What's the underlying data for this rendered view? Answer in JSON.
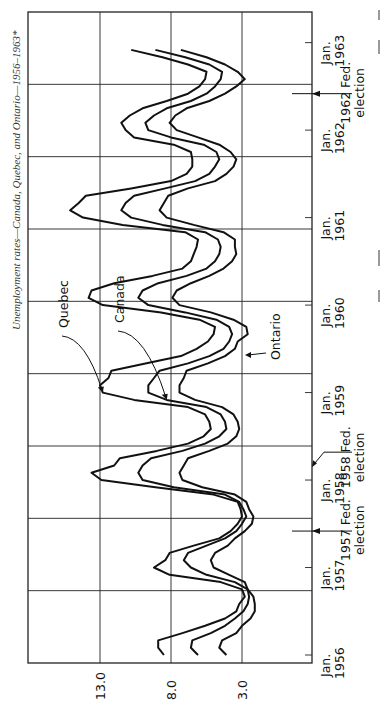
{
  "chart_data": {
    "type": "line",
    "orientation": "rotated-90-ccw",
    "title": "Unemployment rates—Canada, Quebec, and Ontario—1956–1963*",
    "xlabel": "",
    "ylabel": "",
    "x_unit": "month",
    "x_range": [
      "1956-01",
      "1963-01"
    ],
    "y_range": [
      -2,
      18
    ],
    "y_ticks": [
      {
        "value": 3.0,
        "label": "3.0"
      },
      {
        "value": 8.0,
        "label": "8.0"
      },
      {
        "value": 13.0,
        "label": "13.0"
      }
    ],
    "x_ticks": [
      {
        "month": 0,
        "label_line1": "Jan.",
        "label_line2": "1956"
      },
      {
        "month": 12,
        "label_line1": "Jan.",
        "label_line2": "1957"
      },
      {
        "month": 24,
        "label_line1": "Jan.",
        "label_line2": "1958"
      },
      {
        "month": 36,
        "label_line1": "Jan.",
        "label_line2": "1959"
      },
      {
        "month": 48,
        "label_line1": "Jan.",
        "label_line2": "1960"
      },
      {
        "month": 60,
        "label_line1": "Jan.",
        "label_line2": "1961"
      },
      {
        "month": 72,
        "label_line1": "Jan.",
        "label_line2": "1962"
      },
      {
        "month": 84,
        "label_line1": "Jan.",
        "label_line2": "1963"
      }
    ],
    "grid": true,
    "legend": "inline labels with leader arrows",
    "series": [
      {
        "name": "Quebec",
        "months": [
          0,
          1,
          2,
          3,
          4,
          5,
          6,
          7,
          8,
          9,
          10,
          11,
          12,
          13,
          14,
          15,
          16,
          17,
          18,
          19,
          20,
          21,
          22,
          23,
          24,
          25,
          26,
          27,
          28,
          29,
          30,
          31,
          32,
          33,
          34,
          35,
          36,
          37,
          38,
          39,
          40,
          41,
          42,
          43,
          44,
          45,
          46,
          47,
          48,
          49,
          50,
          51,
          52,
          53,
          54,
          55,
          56,
          57,
          58,
          59,
          60,
          61,
          62,
          63,
          64,
          65,
          66,
          67,
          68,
          69,
          70,
          71,
          72,
          73,
          74,
          75,
          76,
          77,
          78,
          79,
          80,
          81,
          82,
          83
        ],
        "values": [
          8.5,
          8.9,
          8.9,
          7.2,
          5.6,
          4.2,
          3.4,
          3.2,
          2.8,
          3.0,
          4.5,
          8.1,
          9.2,
          8.4,
          8.1,
          6.4,
          4.6,
          3.8,
          3.3,
          3.0,
          3.1,
          3.3,
          5.0,
          9.1,
          12.9,
          13.6,
          12.0,
          11.6,
          9.0,
          6.8,
          5.7,
          5.2,
          5.3,
          5.6,
          6.8,
          10.6,
          12.8,
          13.0,
          12.4,
          12.2,
          9.8,
          7.3,
          6.2,
          5.4,
          5.0,
          4.9,
          6.0,
          8.7,
          12.8,
          13.8,
          13.6,
          12.0,
          9.3,
          7.2,
          6.6,
          6.4,
          6.2,
          6.1,
          7.0,
          11.4,
          14.2,
          15.1,
          14.5,
          14.0,
          10.8,
          8.0,
          6.9,
          6.5,
          6.5,
          6.6,
          7.8,
          10.6,
          11.2,
          11.5,
          10.9,
          10.0,
          8.3,
          6.8,
          6.0,
          5.6,
          5.5,
          6.8,
          8.6,
          10.8
        ]
      },
      {
        "name": "Canada",
        "months": [
          0,
          1,
          2,
          3,
          4,
          5,
          6,
          7,
          8,
          9,
          10,
          11,
          12,
          13,
          14,
          15,
          16,
          17,
          18,
          19,
          20,
          21,
          22,
          23,
          24,
          25,
          26,
          27,
          28,
          29,
          30,
          31,
          32,
          33,
          34,
          35,
          36,
          37,
          38,
          39,
          40,
          41,
          42,
          43,
          44,
          45,
          46,
          47,
          48,
          49,
          50,
          51,
          52,
          53,
          54,
          55,
          56,
          57,
          58,
          59,
          60,
          61,
          62,
          63,
          64,
          65,
          66,
          67,
          68,
          69,
          70,
          71,
          72,
          73,
          74,
          75,
          76,
          77,
          78,
          79,
          80,
          81,
          82,
          83
        ],
        "values": [
          6.1,
          6.6,
          6.5,
          5.2,
          4.2,
          3.5,
          2.9,
          2.6,
          2.5,
          2.6,
          3.5,
          5.5,
          6.6,
          7.1,
          6.8,
          5.5,
          4.2,
          3.4,
          3.0,
          2.7,
          2.9,
          3.2,
          4.2,
          7.8,
          10.0,
          10.3,
          10.0,
          9.4,
          7.2,
          5.6,
          4.6,
          4.1,
          4.2,
          4.5,
          5.5,
          8.3,
          9.6,
          9.6,
          9.2,
          8.8,
          6.8,
          5.3,
          4.3,
          3.9,
          3.7,
          3.9,
          4.8,
          7.0,
          9.6,
          10.3,
          10.0,
          8.9,
          6.9,
          5.5,
          4.9,
          4.6,
          4.5,
          4.7,
          5.6,
          8.6,
          10.8,
          11.5,
          11.2,
          10.6,
          8.4,
          6.3,
          5.3,
          4.9,
          4.6,
          4.8,
          5.7,
          8.0,
          9.6,
          9.8,
          9.2,
          8.3,
          6.6,
          5.5,
          4.9,
          4.5,
          4.4,
          5.3,
          7.0,
          9.1
        ]
      },
      {
        "name": "Ontario",
        "months": [
          0,
          1,
          2,
          3,
          4,
          5,
          6,
          7,
          8,
          9,
          10,
          11,
          12,
          13,
          14,
          15,
          16,
          17,
          18,
          19,
          20,
          21,
          22,
          23,
          24,
          25,
          26,
          27,
          28,
          29,
          30,
          31,
          32,
          33,
          34,
          35,
          36,
          37,
          38,
          39,
          40,
          41,
          42,
          43,
          44,
          45,
          46,
          47,
          48,
          49,
          50,
          51,
          52,
          53,
          54,
          55,
          56,
          57,
          58,
          59,
          60,
          61,
          62,
          63,
          64,
          65,
          66,
          67,
          68,
          69,
          70,
          71,
          72,
          73,
          74,
          75,
          76,
          77,
          78,
          79,
          80,
          81,
          82,
          83
        ],
        "values": [
          4.1,
          4.6,
          4.4,
          3.4,
          3.0,
          2.4,
          2.1,
          2.1,
          2.2,
          2.6,
          2.8,
          3.9,
          5.0,
          5.2,
          4.9,
          4.0,
          3.5,
          2.8,
          2.3,
          2.2,
          2.5,
          2.7,
          3.5,
          5.8,
          7.2,
          7.4,
          7.1,
          6.8,
          5.3,
          4.0,
          3.4,
          3.2,
          3.3,
          3.6,
          4.4,
          6.3,
          7.4,
          7.4,
          7.1,
          6.9,
          5.4,
          4.2,
          3.5,
          3.3,
          2.6,
          2.7,
          3.6,
          5.2,
          7.4,
          7.9,
          7.6,
          6.6,
          5.3,
          4.3,
          3.7,
          3.4,
          3.5,
          3.5,
          4.3,
          6.4,
          8.3,
          8.8,
          8.5,
          8.2,
          6.8,
          4.9,
          4.1,
          3.6,
          3.4,
          3.8,
          4.6,
          6.1,
          7.6,
          8.1,
          7.7,
          6.9,
          5.3,
          4.2,
          3.4,
          2.8,
          3.3,
          4.2,
          5.5,
          7.3
        ]
      }
    ],
    "annotations": [
      {
        "text": "Quebec",
        "points_to_series": "Quebec",
        "at_month": 36
      },
      {
        "text": "Canada",
        "points_to_series": "Canada",
        "at_month": 35
      },
      {
        "text": "Ontario",
        "points_to_series": "Ontario",
        "at_month": 44
      },
      {
        "text_line1": "1957 Fed.",
        "text_line2": "election",
        "month": 17,
        "type": "arrow"
      },
      {
        "text_line1": "1958 Fed.",
        "text_line2": "election",
        "month": 27,
        "type": "arrow"
      },
      {
        "text_line1": "1962 Fed.",
        "text_line2": "election",
        "month": 77,
        "type": "arrow"
      }
    ]
  }
}
